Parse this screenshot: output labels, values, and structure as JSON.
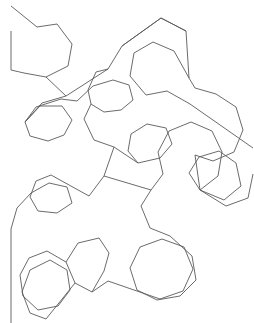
{
  "figure": {
    "name": "fractal-tessellation-curve",
    "background_color": "#ffffff",
    "stroke_color": "#5a5a5a",
    "stroke_width": 0.9,
    "canvas": {
      "width": 254,
      "height": 323
    },
    "view_box": "0 0 254 323"
  },
  "chart_data": {
    "type": "line",
    "title": "",
    "xlabel": "",
    "ylabel": "",
    "grid": false,
    "legend": null,
    "xlim": [
      0,
      254
    ],
    "ylim": [
      0,
      323
    ],
    "series": [
      {
        "name": "curve-segment-1",
        "points": [
          [
            11,
            6
          ],
          [
            37,
            27
          ],
          [
            57,
            24
          ],
          [
            72,
            44
          ],
          [
            68,
            66
          ],
          [
            46,
            77
          ],
          [
            24,
            73
          ],
          [
            11,
            70
          ],
          [
            11,
            31
          ]
        ]
      },
      {
        "name": "curve-segment-2",
        "points": [
          [
            46,
            77
          ],
          [
            66,
            96
          ],
          [
            108,
            69
          ],
          [
            122,
            46
          ],
          [
            161,
            18
          ],
          [
            186,
            31
          ],
          [
            189,
            78
          ],
          [
            174,
            51
          ],
          [
            153,
            42
          ],
          [
            134,
            53
          ],
          [
            130,
            76
          ],
          [
            146,
            95
          ],
          [
            167,
            91
          ],
          [
            190,
            104
          ],
          [
            253,
            148
          ]
        ]
      },
      {
        "name": "curve-segment-3",
        "points": [
          [
            108,
            69
          ],
          [
            96,
            72
          ],
          [
            88,
            90
          ],
          [
            91,
            104
          ],
          [
            104,
            112
          ],
          [
            121,
            110
          ],
          [
            133,
            100
          ],
          [
            129,
            85
          ],
          [
            113,
            80
          ],
          [
            93,
            86
          ],
          [
            77,
            101
          ],
          [
            61,
            99
          ],
          [
            36,
            107
          ],
          [
            25,
            122
          ],
          [
            30,
            136
          ],
          [
            48,
            141
          ],
          [
            64,
            135
          ],
          [
            72,
            120
          ],
          [
            62,
            106
          ],
          [
            40,
            106
          ],
          [
            25,
            122
          ]
        ]
      },
      {
        "name": "curve-segment-4",
        "points": [
          [
            91,
            104
          ],
          [
            84,
            119
          ],
          [
            94,
            140
          ],
          [
            114,
            147
          ],
          [
            104,
            176
          ],
          [
            89,
            196
          ],
          [
            51,
            175
          ],
          [
            36,
            181
          ],
          [
            30,
            197
          ],
          [
            38,
            211
          ],
          [
            57,
            213
          ],
          [
            72,
            203
          ],
          [
            67,
            187
          ],
          [
            49,
            183
          ],
          [
            31,
            193
          ],
          [
            17,
            208
          ],
          [
            11,
            229
          ],
          [
            11,
            323
          ]
        ]
      },
      {
        "name": "curve-segment-5",
        "points": [
          [
            104,
            176
          ],
          [
            151,
            190
          ],
          [
            163,
            174
          ],
          [
            158,
            152
          ],
          [
            169,
            131
          ],
          [
            191,
            122
          ],
          [
            212,
            131
          ],
          [
            222,
            152
          ],
          [
            218,
            176
          ],
          [
            200,
            190
          ],
          [
            224,
            200
          ],
          [
            241,
            186
          ],
          [
            236,
            163
          ],
          [
            219,
            151
          ],
          [
            199,
            157
          ],
          [
            189,
            173
          ],
          [
            200,
            190
          ]
        ]
      },
      {
        "name": "curve-segment-6",
        "points": [
          [
            151,
            190
          ],
          [
            141,
            206
          ],
          [
            150,
            228
          ],
          [
            170,
            236
          ],
          [
            192,
            256
          ],
          [
            196,
            280
          ],
          [
            180,
            296
          ],
          [
            157,
            300
          ],
          [
            137,
            290
          ],
          [
            130,
            268
          ],
          [
            140,
            247
          ],
          [
            162,
            239
          ],
          [
            184,
            247
          ],
          [
            193,
            269
          ],
          [
            183,
            291
          ],
          [
            160,
            299
          ],
          [
            108,
            281
          ],
          [
            92,
            292
          ],
          [
            75,
            283
          ],
          [
            66,
            262
          ],
          [
            78,
            243
          ],
          [
            99,
            238
          ],
          [
            109,
            253
          ],
          [
            104,
            271
          ],
          [
            92,
            292
          ]
        ]
      },
      {
        "name": "curve-segment-7",
        "points": [
          [
            75,
            283
          ],
          [
            46,
            319
          ],
          [
            30,
            313
          ],
          [
            22,
            292
          ],
          [
            30,
            270
          ],
          [
            50,
            260
          ],
          [
            67,
            270
          ],
          [
            70,
            290
          ],
          [
            58,
            306
          ],
          [
            38,
            310
          ],
          [
            23,
            296
          ],
          [
            20,
            275
          ],
          [
            29,
            258
          ],
          [
            47,
            251
          ],
          [
            66,
            262
          ]
        ]
      },
      {
        "name": "curve-segment-8",
        "points": [
          [
            114,
            147
          ],
          [
            138,
            163
          ],
          [
            160,
            158
          ],
          [
            172,
            144
          ],
          [
            166,
            128
          ],
          [
            147,
            124
          ],
          [
            131,
            134
          ],
          [
            128,
            151
          ],
          [
            138,
            163
          ]
        ]
      },
      {
        "name": "curve-segment-9",
        "points": [
          [
            189,
            78
          ],
          [
            195,
            88
          ],
          [
            216,
            94
          ],
          [
            236,
            107
          ],
          [
            243,
            130
          ],
          [
            234,
            152
          ],
          [
            213,
            161
          ],
          [
            195,
            155
          ],
          [
            200,
            190
          ],
          [
            226,
            206
          ],
          [
            248,
            198
          ],
          [
            253,
            174
          ]
        ]
      },
      {
        "name": "curve-segment-10",
        "points": [
          [
            66,
            96
          ],
          [
            42,
            103
          ],
          [
            25,
            122
          ]
        ]
      },
      {
        "name": "curve-segment-11",
        "points": [
          [
            122,
            46
          ],
          [
            161,
            18
          ],
          [
            186,
            31
          ]
        ]
      }
    ]
  }
}
